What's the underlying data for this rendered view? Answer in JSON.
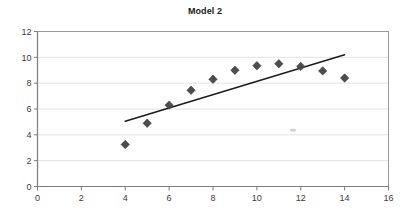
{
  "chart_data": {
    "type": "scatter",
    "title": "Model 2",
    "xlabel": "",
    "ylabel": "",
    "xlim": [
      0,
      16
    ],
    "ylim": [
      0,
      12
    ],
    "xticks": [
      0,
      2,
      4,
      6,
      8,
      10,
      12,
      14,
      16
    ],
    "yticks": [
      0,
      2,
      4,
      6,
      8,
      10,
      12
    ],
    "grid": "horizontal",
    "legend": "none",
    "series": [
      {
        "name": "observed",
        "marker": "diamond",
        "color": "#4d4d4d",
        "x": [
          4,
          5,
          6,
          7,
          8,
          9,
          10,
          11,
          12,
          13,
          14
        ],
        "y": [
          3.25,
          4.9,
          6.3,
          7.45,
          8.3,
          9.0,
          9.35,
          9.5,
          9.3,
          8.95,
          8.4
        ]
      },
      {
        "name": "trendline",
        "type": "line",
        "color": "#1c1c1c",
        "x": [
          4,
          14
        ],
        "y": [
          5.05,
          10.2
        ]
      }
    ]
  },
  "axis": {
    "x_tick_labels": [
      "0",
      "2",
      "4",
      "6",
      "8",
      "10",
      "12",
      "14",
      "16"
    ],
    "y_tick_labels": [
      "0",
      "2",
      "4",
      "6",
      "8",
      "10",
      "12"
    ]
  },
  "title": {
    "text": "Model 2"
  }
}
